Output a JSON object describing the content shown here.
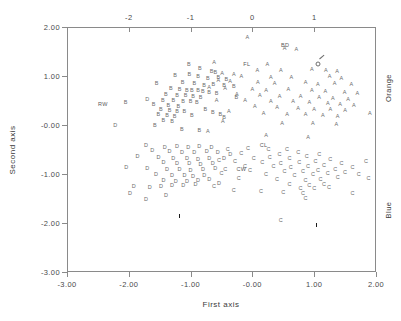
{
  "chart_data": {
    "type": "scatter",
    "title": "",
    "xlabel": "First axis",
    "ylabel": "Second axis",
    "xlim": [
      -3.0,
      2.0
    ],
    "ylim": [
      -3.0,
      2.0
    ],
    "grid": false,
    "legend_position": "right-outside",
    "bottom_axis": {
      "ticks": [
        -3.0,
        -2.0,
        -1.0,
        0.0,
        1.0,
        2.0
      ],
      "tick_labels": [
        "-3.00",
        "-2.00",
        "-1.00",
        "-0.00",
        "1.00",
        "2.00"
      ]
    },
    "left_axis": {
      "ticks": [
        -3.0,
        -2.0,
        -1.0,
        0.0,
        1.0,
        2.0
      ],
      "tick_labels": [
        "-3.00",
        "-2.00",
        "-1.00",
        "-0.00",
        "1.00",
        "2.00"
      ]
    },
    "top_axis": {
      "ticks": [
        -2.0,
        -1.0,
        0.0,
        1.0
      ],
      "tick_labels": [
        "-2",
        "-1",
        "0",
        "1"
      ]
    },
    "right_axis": {
      "labels": [
        "Orange",
        "Blue"
      ]
    },
    "groups": [
      {
        "name": "A",
        "label": "A",
        "color": "#6b6b6b"
      },
      {
        "name": "B",
        "label": "B",
        "color": "#6b6b6b"
      },
      {
        "name": "C",
        "label": "C",
        "color": "#6b6b6b"
      },
      {
        "name": "D",
        "label": "D",
        "color": "#6b6b6b"
      }
    ],
    "annotations": [
      {
        "text": "FL",
        "x": -0.09,
        "y": 1.22
      },
      {
        "text": "BD",
        "x": 0.53,
        "y": 1.62
      },
      {
        "text": "CL",
        "x": 0.18,
        "y": -0.43
      },
      {
        "text": "CW",
        "x": -0.18,
        "y": -0.92
      },
      {
        "text": "RW",
        "x": -2.42,
        "y": 0.4
      }
    ],
    "special_markers": [
      {
        "symbol": "male",
        "x": 1.1,
        "y": 1.27
      },
      {
        "symbol": "centroid",
        "x": -1.22,
        "y": -1.72
      },
      {
        "symbol": "centroid",
        "x": 1.0,
        "y": -1.9
      }
    ],
    "series": [
      {
        "name": "A",
        "points": [
          [
            -0.08,
            1.77
          ],
          [
            0.52,
            1.56
          ],
          [
            0.71,
            1.54
          ],
          [
            -0.62,
            1.26
          ],
          [
            0.24,
            1.22
          ],
          [
            0.08,
            1.1
          ],
          [
            0.46,
            1.1
          ],
          [
            0.96,
            1.12
          ],
          [
            1.19,
            1.11
          ],
          [
            1.37,
            1.09
          ],
          [
            -0.49,
            1.05
          ],
          [
            -0.3,
            1.02
          ],
          [
            -0.18,
            0.98
          ],
          [
            0.3,
            0.96
          ],
          [
            0.63,
            0.96
          ],
          [
            1.25,
            0.98
          ],
          [
            1.44,
            0.94
          ],
          [
            -0.55,
            0.9
          ],
          [
            -0.36,
            0.88
          ],
          [
            0.09,
            0.86
          ],
          [
            0.36,
            0.84
          ],
          [
            0.86,
            0.86
          ],
          [
            1.06,
            0.82
          ],
          [
            1.33,
            0.84
          ],
          [
            1.6,
            0.81
          ],
          [
            -0.7,
            0.76
          ],
          [
            -0.44,
            0.74
          ],
          [
            0.0,
            0.72
          ],
          [
            0.22,
            0.7
          ],
          [
            0.58,
            0.72
          ],
          [
            0.96,
            0.7
          ],
          [
            1.18,
            0.68
          ],
          [
            1.49,
            0.66
          ],
          [
            1.7,
            0.63
          ],
          [
            -0.25,
            0.62
          ],
          [
            0.12,
            0.6
          ],
          [
            0.44,
            0.58
          ],
          [
            0.78,
            0.58
          ],
          [
            1.08,
            0.56
          ],
          [
            1.3,
            0.54
          ],
          [
            1.55,
            0.52
          ],
          [
            -0.58,
            0.5
          ],
          [
            -0.12,
            0.48
          ],
          [
            0.3,
            0.46
          ],
          [
            0.66,
            0.46
          ],
          [
            0.92,
            0.44
          ],
          [
            1.22,
            0.42
          ],
          [
            1.42,
            0.4
          ],
          [
            1.64,
            0.38
          ],
          [
            0.04,
            0.36
          ],
          [
            0.4,
            0.34
          ],
          [
            0.74,
            0.32
          ],
          [
            1.0,
            0.3
          ],
          [
            1.26,
            0.3
          ],
          [
            1.5,
            0.28
          ],
          [
            -0.38,
            0.26
          ],
          [
            0.18,
            0.22
          ],
          [
            0.56,
            0.2
          ],
          [
            0.86,
            0.2
          ],
          [
            1.14,
            0.18
          ],
          [
            1.38,
            0.16
          ],
          [
            -0.48,
            0.06
          ],
          [
            0.48,
            0.02
          ],
          [
            0.98,
            0.02
          ],
          [
            1.36,
            0.0
          ],
          [
            -0.72,
            -0.14
          ],
          [
            0.22,
            -0.22
          ],
          [
            0.9,
            -0.26
          ],
          [
            1.9,
            0.22
          ]
        ]
      },
      {
        "name": "B",
        "points": [
          [
            -1.03,
            1.23
          ],
          [
            -0.85,
            1.14
          ],
          [
            -1.02,
            1.02
          ],
          [
            -0.66,
            1.08
          ],
          [
            -0.6,
            1.06
          ],
          [
            -1.25,
            1.0
          ],
          [
            -0.88,
            0.98
          ],
          [
            -0.72,
            0.94
          ],
          [
            -0.55,
            0.96
          ],
          [
            -0.42,
            0.92
          ],
          [
            -1.55,
            0.84
          ],
          [
            -1.13,
            0.86
          ],
          [
            -0.94,
            0.84
          ],
          [
            -0.78,
            0.8
          ],
          [
            -0.63,
            0.82
          ],
          [
            -0.46,
            0.8
          ],
          [
            -1.32,
            0.74
          ],
          [
            -1.18,
            0.72
          ],
          [
            -1.06,
            0.7
          ],
          [
            -0.98,
            0.7
          ],
          [
            -0.88,
            0.7
          ],
          [
            -0.8,
            0.68
          ],
          [
            -0.7,
            0.66
          ],
          [
            -0.58,
            0.64
          ],
          [
            -1.4,
            0.62
          ],
          [
            -1.22,
            0.6
          ],
          [
            -1.08,
            0.6
          ],
          [
            -0.96,
            0.58
          ],
          [
            -0.84,
            0.56
          ],
          [
            -1.45,
            0.5
          ],
          [
            -1.28,
            0.48
          ],
          [
            -1.12,
            0.46
          ],
          [
            -1.0,
            0.46
          ],
          [
            -0.9,
            0.44
          ],
          [
            -2.05,
            0.44
          ],
          [
            -1.6,
            0.4
          ],
          [
            -1.36,
            0.38
          ],
          [
            -1.2,
            0.36
          ],
          [
            -1.48,
            0.3
          ],
          [
            -1.34,
            0.28
          ],
          [
            -1.22,
            0.26
          ],
          [
            -1.1,
            0.26
          ],
          [
            -1.52,
            0.2
          ],
          [
            -1.38,
            0.18
          ],
          [
            -1.26,
            0.16
          ],
          [
            -1.44,
            0.08
          ],
          [
            -1.3,
            0.06
          ],
          [
            -0.64,
            0.24
          ],
          [
            -0.52,
            0.2
          ],
          [
            -0.46,
            0.14
          ],
          [
            -1.58,
            -0.02
          ],
          [
            -1.14,
            -0.1
          ],
          [
            -0.86,
            -0.12
          ],
          [
            -0.98,
            0.18
          ],
          [
            -0.76,
            0.3
          ],
          [
            -0.3,
            0.78
          ],
          [
            -0.26,
            0.56
          ]
        ]
      },
      {
        "name": "C",
        "points": [
          [
            -0.07,
            -0.48
          ],
          [
            0.26,
            -0.5
          ],
          [
            -0.4,
            -0.52
          ],
          [
            0.56,
            -0.52
          ],
          [
            -0.18,
            -0.6
          ],
          [
            0.44,
            -0.62
          ],
          [
            0.74,
            -0.58
          ],
          [
            0.28,
            -0.68
          ],
          [
            0.02,
            -0.7
          ],
          [
            0.6,
            -0.7
          ],
          [
            0.88,
            -0.66
          ],
          [
            1.08,
            -0.62
          ],
          [
            -0.54,
            -0.74
          ],
          [
            -0.28,
            -0.76
          ],
          [
            0.16,
            -0.78
          ],
          [
            0.46,
            -0.8
          ],
          [
            0.76,
            -0.78
          ],
          [
            1.02,
            -0.76
          ],
          [
            1.26,
            -0.72
          ],
          [
            -0.12,
            -0.86
          ],
          [
            0.34,
            -0.86
          ],
          [
            0.62,
            -0.88
          ],
          [
            0.9,
            -0.86
          ],
          [
            1.16,
            -0.84
          ],
          [
            1.44,
            -0.8
          ],
          [
            -0.44,
            -0.92
          ],
          [
            -0.04,
            -0.94
          ],
          [
            0.52,
            -0.96
          ],
          [
            0.82,
            -0.96
          ],
          [
            1.06,
            -0.94
          ],
          [
            1.34,
            -0.92
          ],
          [
            1.62,
            -0.88
          ],
          [
            0.22,
            -1.02
          ],
          [
            0.68,
            -1.04
          ],
          [
            0.98,
            -1.02
          ],
          [
            1.22,
            -1.0
          ],
          [
            1.5,
            -0.98
          ],
          [
            -0.22,
            -1.1
          ],
          [
            0.4,
            -1.12
          ],
          [
            0.86,
            -1.14
          ],
          [
            1.1,
            -1.12
          ],
          [
            1.38,
            -1.08
          ],
          [
            0.6,
            -1.22
          ],
          [
            0.92,
            -1.24
          ],
          [
            1.16,
            -1.22
          ],
          [
            0.78,
            -1.3
          ],
          [
            1.0,
            -1.3
          ],
          [
            1.24,
            -1.28
          ],
          [
            -0.3,
            -1.34
          ],
          [
            0.14,
            -1.36
          ],
          [
            0.5,
            -1.38
          ],
          [
            0.82,
            -1.4
          ],
          [
            1.62,
            -1.4
          ],
          [
            1.88,
            -1.1
          ],
          [
            1.72,
            -1.02
          ],
          [
            -0.62,
            -1.26
          ],
          [
            0.86,
            -1.52
          ],
          [
            0.46,
            -1.96
          ],
          [
            -0.5,
            -1.0
          ],
          [
            1.84,
            -0.76
          ]
        ]
      },
      {
        "name": "D",
        "points": [
          [
            -1.72,
            -0.42
          ],
          [
            -1.42,
            -0.46
          ],
          [
            -1.22,
            -0.44
          ],
          [
            -1.04,
            -0.46
          ],
          [
            -0.86,
            -0.44
          ],
          [
            -0.66,
            -0.46
          ],
          [
            -1.62,
            -0.54
          ],
          [
            -1.34,
            -0.56
          ],
          [
            -1.14,
            -0.58
          ],
          [
            -0.94,
            -0.58
          ],
          [
            -0.74,
            -0.56
          ],
          [
            -0.56,
            -0.58
          ],
          [
            -1.86,
            -0.66
          ],
          [
            -1.52,
            -0.68
          ],
          [
            -1.28,
            -0.7
          ],
          [
            -1.06,
            -0.7
          ],
          [
            -0.88,
            -0.72
          ],
          [
            -0.7,
            -0.7
          ],
          [
            -1.44,
            -0.78
          ],
          [
            -1.22,
            -0.8
          ],
          [
            -1.02,
            -0.8
          ],
          [
            -0.84,
            -0.82
          ],
          [
            -0.64,
            -0.8
          ],
          [
            -2.04,
            -0.88
          ],
          [
            -1.7,
            -0.9
          ],
          [
            -1.38,
            -0.92
          ],
          [
            -1.18,
            -0.92
          ],
          [
            -1.0,
            -0.94
          ],
          [
            -0.8,
            -0.92
          ],
          [
            -0.6,
            -0.9
          ],
          [
            -1.56,
            -1.02
          ],
          [
            -1.3,
            -1.04
          ],
          [
            -1.1,
            -1.04
          ],
          [
            -0.96,
            -1.06
          ],
          [
            -0.78,
            -1.04
          ],
          [
            -1.44,
            -1.14
          ],
          [
            -1.24,
            -1.16
          ],
          [
            -1.06,
            -1.16
          ],
          [
            -0.88,
            -1.14
          ],
          [
            -0.7,
            -1.12
          ],
          [
            -1.92,
            -1.26
          ],
          [
            -1.66,
            -1.28
          ],
          [
            -1.48,
            -1.26
          ],
          [
            -1.3,
            -1.24
          ],
          [
            -1.12,
            -1.24
          ],
          [
            -0.92,
            -1.22
          ],
          [
            -0.54,
            -1.2
          ],
          [
            -1.98,
            -1.4
          ],
          [
            -1.4,
            -1.44
          ],
          [
            -1.72,
            -1.54
          ],
          [
            -0.46,
            -0.7
          ],
          [
            -0.36,
            -0.62
          ],
          [
            -2.22,
            -0.02
          ],
          [
            -1.7,
            0.52
          ]
        ]
      }
    ]
  }
}
